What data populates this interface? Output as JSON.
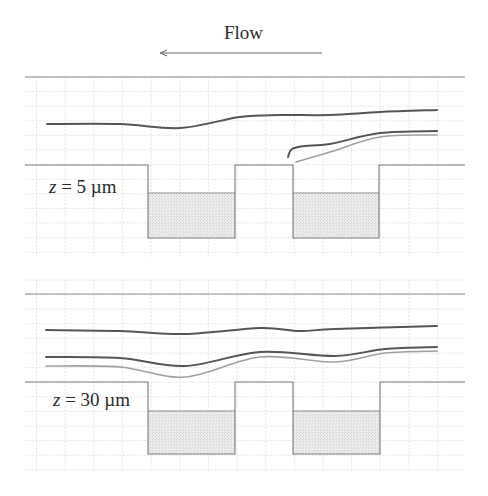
{
  "figure": {
    "flow_label": "Flow",
    "flow_direction": "left",
    "colors": {
      "background": "#ffffff",
      "grid": "#dcdcdc",
      "wall": "#7a7a7a",
      "fill": "#e4e4e4",
      "streamline_dark": "#555555",
      "streamline_light": "#a0a0a0"
    },
    "panels": [
      {
        "label_var": "z",
        "label_rest": " = 5 µm",
        "streamlines": [
          {
            "style": "dark",
            "points": [
              [
                47,
                124
              ],
              [
                120,
                124
              ],
              [
                180,
                128
              ],
              [
                240,
                117
              ],
              [
                280,
                115
              ],
              [
                330,
                115
              ],
              [
                380,
                112
              ],
              [
                437,
                110
              ]
            ]
          },
          {
            "style": "dark",
            "points": [
              [
                288,
                157
              ],
              [
                292,
                149
              ],
              [
                305,
                146
              ],
              [
                330,
                144
              ],
              [
                380,
                133
              ],
              [
                437,
                131
              ]
            ]
          },
          {
            "style": "light",
            "points": [
              [
                296,
                162
              ],
              [
                330,
                152
              ],
              [
                380,
                137
              ],
              [
                437,
                135
              ]
            ]
          }
        ]
      },
      {
        "label_var": "z",
        "label_rest": " = 30 µm",
        "streamlines": [
          {
            "style": "dark",
            "points": [
              [
                46,
                330
              ],
              [
                120,
                331
              ],
              [
                185,
                334
              ],
              [
                260,
                328
              ],
              [
                300,
                331
              ],
              [
                335,
                329
              ],
              [
                437,
                326
              ]
            ]
          },
          {
            "style": "dark",
            "points": [
              [
                46,
                357
              ],
              [
                120,
                358
              ],
              [
                185,
                366
              ],
              [
                260,
                352
              ],
              [
                335,
                356
              ],
              [
                385,
                349
              ],
              [
                437,
                347
              ]
            ]
          },
          {
            "style": "light",
            "points": [
              [
                46,
                366
              ],
              [
                120,
                367
              ],
              [
                185,
                377
              ],
              [
                260,
                357
              ],
              [
                335,
                362
              ],
              [
                385,
                353
              ],
              [
                437,
                351
              ]
            ]
          }
        ]
      }
    ]
  }
}
